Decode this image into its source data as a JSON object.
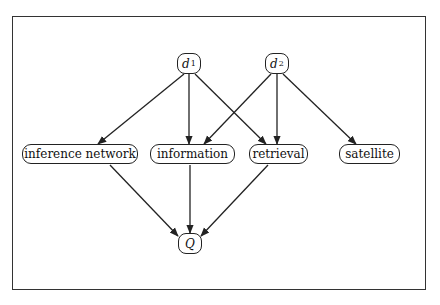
{
  "diagram": {
    "type": "inference-network",
    "nodes": {
      "d1": {
        "label": "d",
        "sub": "1",
        "kind": "document"
      },
      "d2": {
        "label": "d",
        "sub": "2",
        "kind": "document"
      },
      "inference_network": {
        "label": "inference network",
        "kind": "term"
      },
      "information": {
        "label": "information",
        "kind": "term"
      },
      "retrieval": {
        "label": "retrieval",
        "kind": "term"
      },
      "satellite": {
        "label": "satellite",
        "kind": "term"
      },
      "Q": {
        "label": "Q",
        "kind": "query"
      }
    },
    "edges": [
      {
        "from": "d1",
        "to": "inference_network"
      },
      {
        "from": "d1",
        "to": "information"
      },
      {
        "from": "d1",
        "to": "retrieval"
      },
      {
        "from": "d2",
        "to": "information"
      },
      {
        "from": "d2",
        "to": "retrieval"
      },
      {
        "from": "d2",
        "to": "satellite"
      },
      {
        "from": "inference_network",
        "to": "Q"
      },
      {
        "from": "information",
        "to": "Q"
      },
      {
        "from": "retrieval",
        "to": "Q"
      }
    ],
    "colors": {
      "stroke": "#222222",
      "background": "#ffffff"
    }
  }
}
